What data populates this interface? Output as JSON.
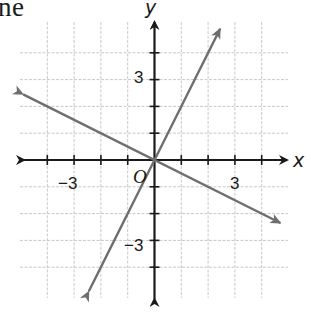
{
  "caption": {
    "fragment": "ne"
  },
  "chart_data": {
    "type": "line",
    "title": "",
    "xlabel": "x",
    "ylabel": "y",
    "origin_label": "O",
    "xlim": [
      -5,
      5
    ],
    "ylim": [
      -5,
      5
    ],
    "grid": true,
    "grid_step": 1,
    "x_tick_labels": [
      {
        "value": -3,
        "text": "−3"
      },
      {
        "value": 3,
        "text": "3"
      }
    ],
    "y_tick_labels": [
      {
        "value": 3,
        "text": "3"
      },
      {
        "value": -3,
        "text": "−3"
      }
    ],
    "series": [
      {
        "name": "line-steep",
        "equation": "y = 2x",
        "points": [
          [
            -2.45,
            -4.9
          ],
          [
            0,
            0
          ],
          [
            2.45,
            4.9
          ]
        ],
        "arrows": "both"
      },
      {
        "name": "line-shallow",
        "equation": "y = -x/2",
        "points": [
          [
            -4.9,
            2.45
          ],
          [
            0,
            0
          ],
          [
            4.7,
            -2.35
          ]
        ],
        "arrows": "both"
      }
    ],
    "colors": {
      "axes": "#1a1a1a",
      "grid": "#c8c8c8",
      "lines": "#6e6e6e"
    }
  }
}
